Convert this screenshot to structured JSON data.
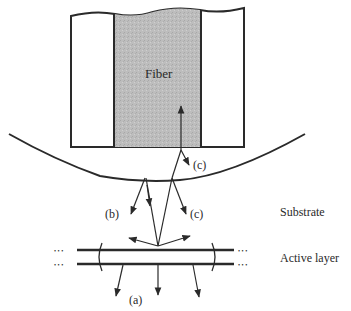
{
  "diagram": {
    "fiber_label": "Fiber",
    "labels": {
      "a": "(a)",
      "b": "(b)",
      "c_lower": "(c)",
      "c_upper": "(c)"
    },
    "layer_labels": {
      "substrate": "Substrate",
      "active_layer": "Active layer"
    },
    "dots": "• • •",
    "colors": {
      "line": "#2a2a2a",
      "fiber_core": "#b8b8b8",
      "background": "#ffffff"
    }
  }
}
